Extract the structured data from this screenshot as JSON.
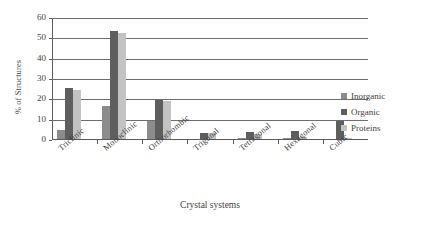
{
  "chart_data": {
    "type": "bar",
    "title": "",
    "xlabel": "Crystal systems",
    "ylabel": "% of Structures",
    "ylim": [
      0,
      60
    ],
    "yticks": [
      0,
      10,
      20,
      30,
      40,
      50,
      60
    ],
    "grid": true,
    "legend_position": "right",
    "categories": [
      "Triclinic",
      "Monoclinic",
      "Orthorhombic",
      "Trigonal",
      "Tetragonal",
      "Hexagonal",
      "Cubic"
    ],
    "series": [
      {
        "name": "Inorganic",
        "color": "#8c8c8c",
        "values": [
          4.5,
          16,
          9,
          0,
          0.5,
          0.5,
          0
        ]
      },
      {
        "name": "Organic",
        "color": "#5e5e5e",
        "values": [
          25,
          53,
          19,
          3,
          3.5,
          4,
          9
        ]
      },
      {
        "name": "Proteins",
        "color": "#c3c3c3",
        "values": [
          24,
          52,
          18.5,
          3,
          2.5,
          1,
          0.5
        ]
      }
    ]
  },
  "colors": {
    "inorganic": "#8c8c8c",
    "organic": "#5e5e5e",
    "proteins": "#c3c3c3",
    "axis": "#5a5a5a",
    "grid": "#6e6e6e",
    "background": "#ffffff"
  }
}
